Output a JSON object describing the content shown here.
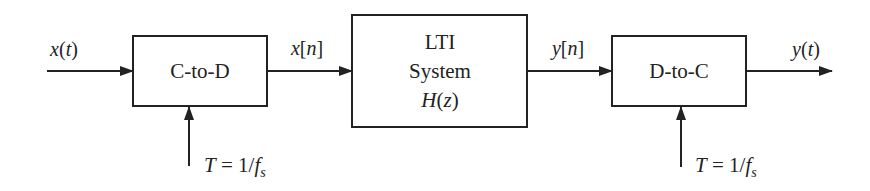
{
  "blocks": {
    "c_to_d": {
      "label": "C-to-D"
    },
    "lti": {
      "line1": "LTI",
      "line2": "System",
      "line3_func": "H",
      "line3_arg": "z"
    },
    "d_to_c": {
      "label": "D-to-C"
    }
  },
  "signals": {
    "input": {
      "name": "x",
      "arg": "t"
    },
    "discrete_in": {
      "name": "x",
      "arg": "n"
    },
    "discrete_out": {
      "name": "y",
      "arg": "n"
    },
    "output": {
      "name": "y",
      "arg": "t"
    }
  },
  "sampling": {
    "c_to_d": {
      "var": "T",
      "eq": " = 1/",
      "f": "f",
      "sub": "s"
    },
    "d_to_c": {
      "var": "T",
      "eq": " = 1/",
      "f": "f",
      "sub": "s"
    }
  },
  "colors": {
    "stroke": "#222222",
    "background": "#ffffff"
  }
}
